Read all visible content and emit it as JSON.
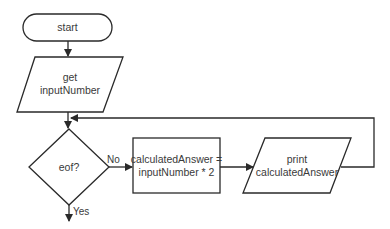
{
  "diagram": {
    "type": "flowchart",
    "nodes": [
      {
        "id": "start",
        "shape": "terminal",
        "lines": [
          "start"
        ]
      },
      {
        "id": "input",
        "shape": "parallelogram",
        "lines": [
          "get",
          "inputNumber"
        ]
      },
      {
        "id": "decision",
        "shape": "diamond",
        "lines": [
          "eof?"
        ]
      },
      {
        "id": "process",
        "shape": "rectangle",
        "lines": [
          "calculatedAnswer =",
          "inputNumber * 2"
        ]
      },
      {
        "id": "output",
        "shape": "parallelogram",
        "lines": [
          "print",
          "calculatedAnswer"
        ]
      }
    ],
    "edges": [
      {
        "from": "start",
        "to": "input",
        "label": ""
      },
      {
        "from": "input",
        "to": "decision",
        "label": ""
      },
      {
        "from": "decision",
        "to": "process",
        "label": "No"
      },
      {
        "from": "process",
        "to": "output",
        "label": ""
      },
      {
        "from": "output",
        "to": "decision",
        "label": ""
      },
      {
        "from": "decision",
        "to": "end",
        "label": "Yes"
      }
    ]
  }
}
